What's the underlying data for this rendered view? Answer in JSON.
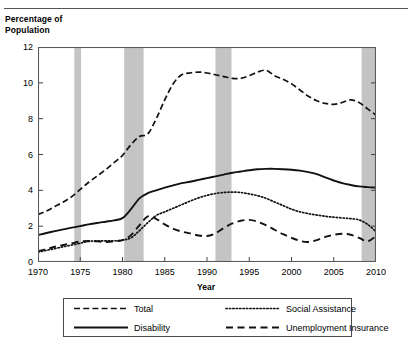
{
  "figure": {
    "y_axis_title": "Percentage of\nPopulation",
    "x_axis_title": "Year"
  },
  "legend": {
    "items": [
      {
        "label": "Total",
        "style": "long-dash",
        "icon": "legend-line-total"
      },
      {
        "label": "Social Assistance",
        "style": "dotted",
        "icon": "legend-line-social-assistance"
      },
      {
        "label": "Disability",
        "style": "solid",
        "icon": "legend-line-disability"
      },
      {
        "label": "Unemployment Insurance",
        "style": "dashed",
        "icon": "legend-line-unemployment-insurance"
      }
    ]
  },
  "chart_data": {
    "type": "line",
    "title": "",
    "xlabel": "Year",
    "ylabel": "Percentage of Population",
    "xlim": [
      1970,
      2010
    ],
    "ylim": [
      0,
      12
    ],
    "xticks": [
      1970,
      1975,
      1980,
      1985,
      1990,
      1995,
      2000,
      2005,
      2010
    ],
    "yticks": [
      0,
      2,
      4,
      6,
      8,
      10,
      12
    ],
    "grid": false,
    "legend_position": "below",
    "shaded_bands": {
      "name": "recession-bands",
      "color": "#c4c4c4",
      "ranges": [
        [
          1974.3,
          1975.1
        ],
        [
          1980.2,
          1982.5
        ],
        [
          1991.0,
          1992.9
        ],
        [
          2008.3,
          2010.0
        ]
      ]
    },
    "x": [
      1970,
      1971,
      1972,
      1973,
      1974,
      1975,
      1976,
      1977,
      1978,
      1979,
      1980,
      1981,
      1982,
      1983,
      1984,
      1985,
      1986,
      1987,
      1988,
      1989,
      1990,
      1991,
      1992,
      1993,
      1994,
      1995,
      1996,
      1997,
      1998,
      1999,
      2000,
      2001,
      2002,
      2003,
      2004,
      2005,
      2006,
      2007,
      2008,
      2009,
      2010
    ],
    "series": [
      {
        "name": "Total",
        "style": "long-dash",
        "values": [
          2.65,
          2.85,
          3.1,
          3.35,
          3.65,
          4.05,
          4.45,
          4.8,
          5.15,
          5.55,
          5.95,
          6.55,
          7.0,
          7.15,
          8.0,
          9.05,
          9.95,
          10.45,
          10.55,
          10.6,
          10.55,
          10.45,
          10.35,
          10.25,
          10.25,
          10.4,
          10.6,
          10.7,
          10.4,
          10.2,
          9.95,
          9.6,
          9.25,
          9.0,
          8.85,
          8.8,
          8.9,
          9.05,
          8.9,
          8.55,
          8.2
        ]
      },
      {
        "name": "Disability",
        "style": "solid",
        "values": [
          1.5,
          1.62,
          1.72,
          1.82,
          1.92,
          2.0,
          2.1,
          2.18,
          2.25,
          2.32,
          2.45,
          2.95,
          3.55,
          3.85,
          4.0,
          4.15,
          4.28,
          4.4,
          4.48,
          4.58,
          4.68,
          4.78,
          4.88,
          4.98,
          5.05,
          5.12,
          5.18,
          5.2,
          5.2,
          5.18,
          5.15,
          5.1,
          5.02,
          4.9,
          4.72,
          4.55,
          4.4,
          4.3,
          4.22,
          4.18,
          4.15
        ]
      },
      {
        "name": "Social Assistance",
        "style": "dotted",
        "values": [
          0.55,
          0.65,
          0.75,
          0.85,
          0.95,
          1.05,
          1.15,
          1.18,
          1.18,
          1.18,
          1.22,
          1.35,
          1.75,
          2.2,
          2.6,
          2.8,
          3.0,
          3.2,
          3.4,
          3.58,
          3.72,
          3.82,
          3.88,
          3.9,
          3.88,
          3.8,
          3.7,
          3.55,
          3.35,
          3.15,
          2.95,
          2.8,
          2.7,
          2.62,
          2.55,
          2.5,
          2.46,
          2.42,
          2.35,
          2.1,
          1.7
        ]
      },
      {
        "name": "Unemployment Insurance",
        "style": "dashed",
        "values": [
          0.6,
          0.72,
          0.85,
          0.95,
          1.05,
          1.15,
          1.18,
          1.15,
          1.12,
          1.15,
          1.22,
          1.5,
          2.05,
          2.55,
          2.4,
          2.1,
          1.85,
          1.7,
          1.6,
          1.48,
          1.45,
          1.6,
          1.9,
          2.15,
          2.3,
          2.35,
          2.25,
          2.05,
          1.8,
          1.55,
          1.35,
          1.18,
          1.12,
          1.22,
          1.4,
          1.52,
          1.58,
          1.52,
          1.35,
          1.15,
          1.45
        ]
      }
    ]
  }
}
